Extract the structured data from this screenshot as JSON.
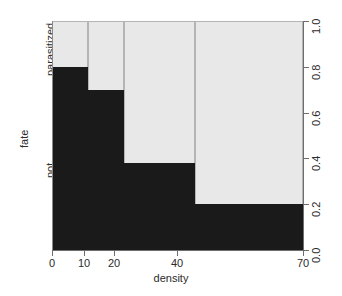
{
  "chart_data": {
    "type": "bar",
    "subtype": "mosaic-spineplot",
    "title": "",
    "xlabel": "density",
    "ylabel": "fate",
    "xticks": [
      0,
      10,
      20,
      40,
      70
    ],
    "xtick_labels": [
      "0",
      "10",
      "20",
      "40",
      "70"
    ],
    "yticks": [
      0.0,
      0.2,
      0.4,
      0.6,
      0.8,
      1.0
    ],
    "ytick_labels": [
      "0.0",
      "0.2",
      "0.4",
      "0.6",
      "0.8",
      "1.0"
    ],
    "xlim": [
      0,
      70
    ],
    "ylim": [
      0.0,
      1.0
    ],
    "grid": false,
    "legend": "none",
    "y_categories": [
      "not",
      "parasitized"
    ],
    "y_category_labels": [
      "not",
      "parasitized"
    ],
    "colors": {
      "not": "#1a1a1a",
      "parasitized": "#e8e8e8",
      "axis": "#6e6e6e",
      "border": "#b4b4b4",
      "background": "#ffffff",
      "text": "#2b2b2b"
    },
    "categories": [
      "0-10",
      "10-20",
      "20-40",
      "40-70"
    ],
    "bins": [
      {
        "label": "0-10",
        "x_start": 0,
        "x_end": 10,
        "not": 0.8,
        "parasitized": 0.2
      },
      {
        "label": "10-20",
        "x_start": 10,
        "x_end": 20,
        "not": 0.7,
        "parasitized": 0.3
      },
      {
        "label": "20-40",
        "x_start": 20,
        "x_end": 40,
        "not": 0.38,
        "parasitized": 0.62
      },
      {
        "label": "40-70",
        "x_start": 40,
        "x_end": 70,
        "not": 0.2,
        "parasitized": 0.8
      }
    ],
    "series": [
      {
        "name": "not",
        "values": [
          0.8,
          0.7,
          0.38,
          0.2
        ]
      },
      {
        "name": "parasitized",
        "values": [
          0.2,
          0.3,
          0.62,
          0.8
        ]
      }
    ]
  }
}
